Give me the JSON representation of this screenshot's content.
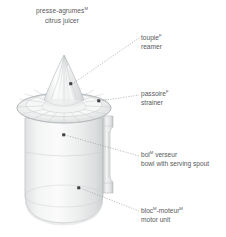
{
  "illustration": {
    "name": "citrus-juicer-technical-illustration",
    "background_color": "#ffffff",
    "body_color": "#eceded",
    "outline_color": "#b9bcbe",
    "shade_color": "#d5d7d9",
    "text_color": "#58595b",
    "leader_color": "#8d9194",
    "dot_color": "#3f4245"
  },
  "title": {
    "french": "presse-agrumes",
    "french_gender": "M",
    "english": "citrus juicer"
  },
  "callouts": [
    {
      "id": "reamer",
      "french": "toupie",
      "french_gender": "F",
      "english": "reamer",
      "dot": {
        "x": 71,
        "y": 84
      }
    },
    {
      "id": "strainer",
      "french": "passoire",
      "french_gender": "F",
      "english": "strainer",
      "dot": {
        "x": 99,
        "y": 101
      }
    },
    {
      "id": "bowl",
      "french": "bol",
      "french_gender": "M",
      "french_tail": " verseur",
      "english": "bowl with serving spout",
      "dot": {
        "x": 64,
        "y": 135
      }
    },
    {
      "id": "motor-unit",
      "french": "bloc",
      "french_gender": "M",
      "french_tail": "-moteur",
      "french_gender2": "M",
      "english": "motor unit",
      "dot": {
        "x": 79,
        "y": 188
      }
    }
  ]
}
